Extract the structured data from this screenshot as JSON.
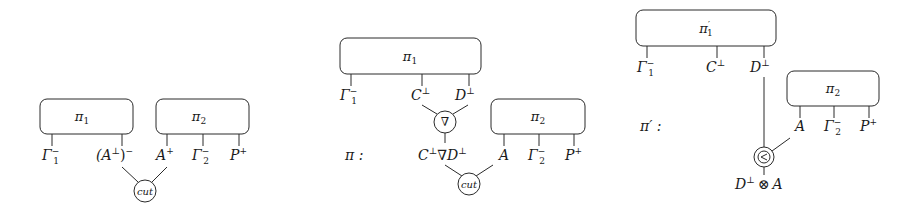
{
  "panels": [
    {
      "id": "before-cut",
      "boxes": [
        {
          "label": "π",
          "sub": "1",
          "prime": "",
          "ports": [
            {
              "base": "Γ",
              "sub": "1",
              "sup": "−"
            },
            {
              "base": "(A",
              "sup_inner": "⊥",
              "tail": ")",
              "sup": "−"
            }
          ]
        },
        {
          "label": "π",
          "sub": "2",
          "prime": "",
          "ports": [
            {
              "base": "A",
              "sup": "+"
            },
            {
              "base": "Γ",
              "sub": "2",
              "sup": "−"
            },
            {
              "base": "P",
              "sup": "+"
            }
          ]
        }
      ],
      "nodes": [
        {
          "kind": "cut",
          "label": "cut"
        }
      ]
    },
    {
      "id": "par-cut",
      "prefix_label": "π :",
      "boxes": [
        {
          "label": "π",
          "sub": "1",
          "prime": "",
          "ports": [
            {
              "base": "Γ",
              "sub": "1",
              "sup": "−"
            },
            {
              "base": "C",
              "sup": "⊥"
            },
            {
              "base": "D",
              "sup": "⊥"
            }
          ]
        },
        {
          "label": "π",
          "sub": "2",
          "prime": "",
          "ports": [
            {
              "base": "A",
              "sup": ""
            },
            {
              "base": "Γ",
              "sub": "2",
              "sup": "−"
            },
            {
              "base": "P",
              "sup": "+"
            }
          ]
        }
      ],
      "nodes": [
        {
          "kind": "par",
          "label": "∇"
        },
        {
          "kind": "cut",
          "label": "cut"
        }
      ],
      "conclusion": {
        "left": "C",
        "left_sup": "⊥",
        "op": "∇",
        "right": "D",
        "right_sup": "⊥"
      }
    },
    {
      "id": "tensor-result",
      "prefix_label": "π′ :",
      "boxes": [
        {
          "label": "π",
          "sub": "1",
          "prime": "′",
          "ports": [
            {
              "base": "Γ",
              "sub": "1",
              "sup": "−"
            },
            {
              "base": "C",
              "sup": "⊥"
            },
            {
              "base": "D",
              "sup": "⊥"
            }
          ]
        },
        {
          "label": "π",
          "sub": "2",
          "prime": "",
          "ports": [
            {
              "base": "A",
              "sup": ""
            },
            {
              "base": "Γ",
              "sub": "2",
              "sup": "−"
            },
            {
              "base": "P",
              "sup": "+"
            }
          ]
        }
      ],
      "nodes": [
        {
          "kind": "tensor",
          "label": "⊗"
        }
      ],
      "conclusion": {
        "left": "D",
        "left_sup": "⊥",
        "op": "⊗",
        "right": "A"
      }
    }
  ]
}
